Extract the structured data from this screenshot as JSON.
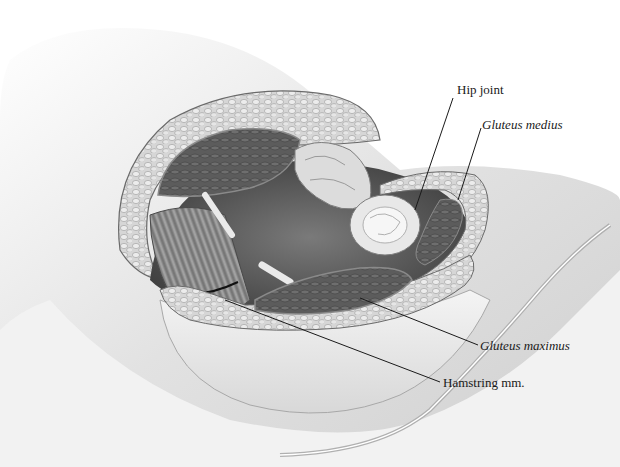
{
  "figure": {
    "labels": [
      {
        "id": "hip-joint",
        "text": "Hip joint",
        "italic": false,
        "x": 457,
        "y": 83,
        "line": [
          453,
          98,
          415,
          210
        ]
      },
      {
        "id": "gluteus-medius",
        "text": "Gluteus medius",
        "italic": true,
        "x": 482,
        "y": 118,
        "line": [
          481,
          128,
          458,
          200
        ]
      },
      {
        "id": "gluteus-maximus",
        "text": "Gluteus maximus",
        "italic": true,
        "x": 480,
        "y": 339,
        "line": [
          360,
          298,
          478,
          345
        ]
      },
      {
        "id": "hamstring-mm",
        "text": "Hamstring mm.",
        "italic": false,
        "x": 443,
        "y": 376,
        "line": [
          225,
          300,
          440,
          382
        ]
      }
    ],
    "colors": {
      "background": "#ffffff",
      "skin": "#eeeeee",
      "skin_shadow": "#c8c8c8",
      "fat_layer": "#c9c9c9",
      "muscle_dark": "#5a5a5a",
      "tendon": "#e6e6e6",
      "leader_line": "#1a1a1a"
    }
  }
}
